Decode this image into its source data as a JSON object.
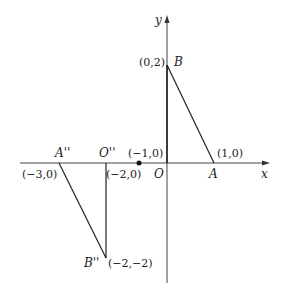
{
  "diagram": {
    "axes": {
      "x_label": "x",
      "y_label": "y",
      "origin_label": "O"
    },
    "original_triangle": {
      "vertices": [
        {
          "name": "B",
          "coord_label": "(0,2)"
        },
        {
          "name": "A",
          "coord_label": "(1,0)"
        },
        {
          "name": "O",
          "coord_label": ""
        }
      ]
    },
    "transformed_triangle": {
      "vertices": [
        {
          "name": "A''",
          "coord_label": "(−3,0)"
        },
        {
          "name": "O''",
          "coord_label": "(−2,0)"
        },
        {
          "name": "B''",
          "coord_label": "(−2,−2)"
        }
      ]
    },
    "center_point": {
      "coord_label": "(−1,0)"
    }
  }
}
